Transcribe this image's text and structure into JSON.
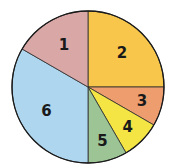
{
  "chart_data": {
    "type": "pie",
    "title": "",
    "start": "12 o'clock, clockwise",
    "slices": [
      {
        "label": "2",
        "value": 25.0,
        "color": "#f7c64a"
      },
      {
        "label": "3",
        "value": 8.33,
        "color": "#ee9e6e"
      },
      {
        "label": "4",
        "value": 8.33,
        "color": "#f4e545"
      },
      {
        "label": "5",
        "value": 8.33,
        "color": "#9dc495"
      },
      {
        "label": "6",
        "value": 33.33,
        "color": "#aed6ef"
      },
      {
        "label": "1",
        "value": 16.67,
        "color": "#d9a7a6"
      }
    ],
    "units": "percent"
  }
}
